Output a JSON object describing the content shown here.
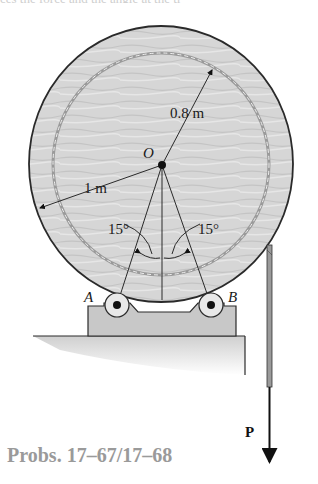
{
  "figure": {
    "caption": "Probs. 17–67/17–68",
    "top_cutoff_text": "ces the force and the angle at the ti"
  },
  "labels": {
    "center": "O",
    "outer_radius": "1 m",
    "inner_radius": "0.8 m",
    "angle_left": "15°",
    "angle_right": "15°",
    "support_a": "A",
    "support_b": "B",
    "force": "P"
  },
  "colors": {
    "drum_fill": "#d9d9d9",
    "outline": "#2a2a2a",
    "block_fill": "#c8c8c8",
    "caption": "#9a9a9a"
  }
}
